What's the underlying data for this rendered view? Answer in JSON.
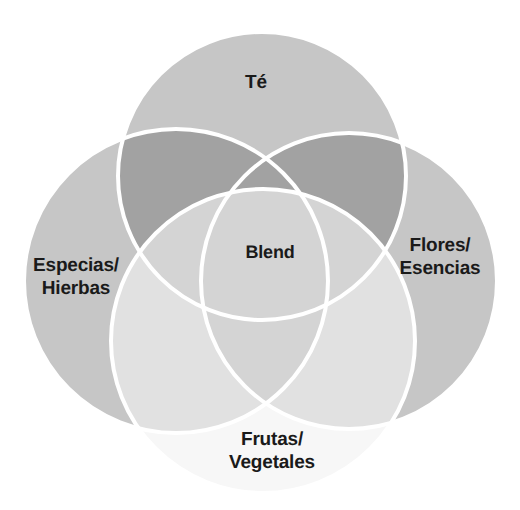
{
  "diagram": {
    "type": "venn",
    "title": "",
    "background_color": "#ffffff",
    "stroke_color": "#ffffff",
    "stroke_width": 4,
    "text_color": "#1a1a1a",
    "sets": [
      {
        "id": "te",
        "label": "Té",
        "label_lines": "Té",
        "cx": 262,
        "cy": 176,
        "r": 144,
        "fill": "#c6c6c6",
        "label_x": 256,
        "label_y": 83
      },
      {
        "id": "especias-hierbas",
        "label": "Especias/Hierbas",
        "label_lines": "Especias/\nHierbas",
        "cx": 176,
        "cy": 281,
        "r": 152,
        "fill": "#c6c6c6",
        "label_x": 76,
        "label_y": 277
      },
      {
        "id": "flores-esencias",
        "label": "Flores/Esencias",
        "label_lines": "Flores/\nEsencias",
        "cx": 349,
        "cy": 281,
        "r": 148,
        "fill": "#c6c6c6",
        "label_x": 440,
        "label_y": 257
      },
      {
        "id": "frutas-vegetales",
        "label": "Frutas/Vegetales",
        "label_lines": "Frutas/\nVegetales",
        "cx": 263,
        "cy": 341,
        "r": 152,
        "fill": "#eeeeee",
        "label_x": 272,
        "label_y": 451
      }
    ],
    "center": {
      "id": "blend",
      "label": "Blend",
      "label_x": 270,
      "label_y": 253
    },
    "overlap_colors": {
      "two_sets": "#a2a2a2",
      "three_sets": "#b4b4b4",
      "light_union": "#d8d8d8"
    }
  }
}
